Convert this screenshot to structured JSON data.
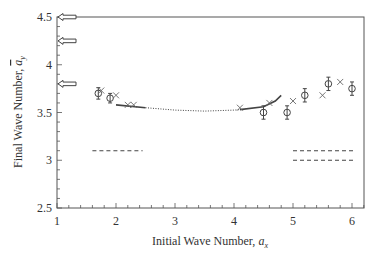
{
  "chart_data": {
    "type": "scatter",
    "title": "",
    "xlabel": "Initial Wave Number, a_x",
    "xlabel_main": "Initial Wave Number, ",
    "xlabel_var": "a",
    "xlabel_sub": "x",
    "ylabel": "Final Wave Number, ā_y",
    "ylabel_main": "Final Wave Number, ",
    "ylabel_var": "a",
    "ylabel_sub": "y",
    "xlim": [
      1,
      6.2
    ],
    "ylim": [
      2.5,
      4.5
    ],
    "xticks": [
      "1",
      "2",
      "3",
      "4",
      "5",
      "6"
    ],
    "yticks": [
      "2.5",
      "3",
      "3.5",
      "4",
      "4.5"
    ],
    "grid": false,
    "legend": null,
    "series": [
      {
        "name": "measured (circles with error bars)",
        "marker": "circle",
        "points": [
          {
            "x": 1.7,
            "y": 3.7,
            "err": 0.06
          },
          {
            "x": 1.9,
            "y": 3.65,
            "err": 0.05
          },
          {
            "x": 4.5,
            "y": 3.5,
            "err": 0.07
          },
          {
            "x": 4.9,
            "y": 3.5,
            "err": 0.07
          },
          {
            "x": 5.2,
            "y": 3.68,
            "err": 0.07
          },
          {
            "x": 5.6,
            "y": 3.8,
            "err": 0.07
          },
          {
            "x": 6.0,
            "y": 3.75,
            "err": 0.07
          }
        ]
      },
      {
        "name": "computed (crosses)",
        "marker": "x",
        "points": [
          {
            "x": 1.75,
            "y": 3.73
          },
          {
            "x": 2.0,
            "y": 3.68
          },
          {
            "x": 2.2,
            "y": 3.58
          },
          {
            "x": 2.3,
            "y": 3.58
          },
          {
            "x": 4.1,
            "y": 3.55
          },
          {
            "x": 4.6,
            "y": 3.6
          },
          {
            "x": 5.0,
            "y": 3.62
          },
          {
            "x": 5.5,
            "y": 3.68
          },
          {
            "x": 5.8,
            "y": 3.82
          }
        ]
      },
      {
        "name": "stability curve (solid)",
        "type": "line",
        "style": "solid",
        "points": [
          [
            2.0,
            3.58
          ],
          [
            2.5,
            3.55
          ]
        ]
      },
      {
        "name": "stability curve (dotted)",
        "type": "line",
        "style": "dotted",
        "points": [
          [
            2.5,
            3.55
          ],
          [
            3.0,
            3.525
          ],
          [
            3.5,
            3.515
          ],
          [
            4.0,
            3.525
          ],
          [
            4.1,
            3.53
          ]
        ]
      },
      {
        "name": "stability curve right (solid)",
        "type": "line",
        "style": "solid",
        "points": [
          [
            4.1,
            3.53
          ],
          [
            4.5,
            3.56
          ],
          [
            4.7,
            3.62
          ],
          [
            4.8,
            3.68
          ]
        ]
      },
      {
        "name": "dashed level left",
        "type": "line",
        "style": "dashed",
        "points": [
          [
            1.6,
            3.1
          ],
          [
            2.45,
            3.1
          ]
        ]
      },
      {
        "name": "dashed level right upper",
        "type": "line",
        "style": "dashed",
        "points": [
          [
            5.0,
            3.1
          ],
          [
            6.05,
            3.1
          ]
        ]
      },
      {
        "name": "dashed level right lower",
        "type": "line",
        "style": "dashed",
        "points": [
          [
            5.0,
            3.0
          ],
          [
            6.05,
            3.0
          ]
        ]
      }
    ],
    "annotations": [
      {
        "type": "arrow-left",
        "y": 4.5
      },
      {
        "type": "arrow-left",
        "y": 4.25
      },
      {
        "type": "arrow-left",
        "y": 3.8
      }
    ]
  },
  "colors": {
    "axis": "#555555",
    "data": "#444444",
    "background": "#ffffff"
  }
}
